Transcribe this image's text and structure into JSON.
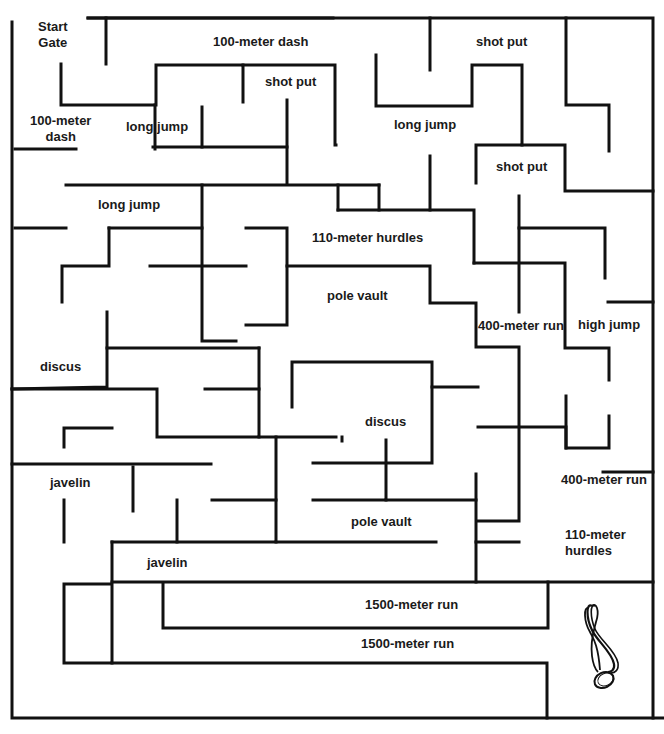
{
  "colors": {
    "wall": "#111111",
    "background": "#ffffff",
    "text": "#1a1a1a"
  },
  "labels": [
    {
      "id": "start-gate",
      "text": "Start\nGate",
      "x": 38,
      "y": 19,
      "center": true
    },
    {
      "id": "100m-dash-top",
      "text": "100-meter dash",
      "x": 213,
      "y": 34
    },
    {
      "id": "shot-put-top",
      "text": "shot put",
      "x": 476,
      "y": 34
    },
    {
      "id": "shot-put-mid",
      "text": "shot put",
      "x": 265,
      "y": 74
    },
    {
      "id": "100m-dash-left",
      "text": "100-meter\ndash",
      "x": 30,
      "y": 113,
      "center": true
    },
    {
      "id": "long-jump-1",
      "text": "long jump",
      "x": 126,
      "y": 119
    },
    {
      "id": "long-jump-2",
      "text": "long jump",
      "x": 394,
      "y": 117
    },
    {
      "id": "shot-put-right",
      "text": "shot put",
      "x": 496,
      "y": 159
    },
    {
      "id": "long-jump-3",
      "text": "long jump",
      "x": 98,
      "y": 197
    },
    {
      "id": "110m-hurdles-top",
      "text": "110-meter hurdles",
      "x": 312,
      "y": 230
    },
    {
      "id": "pole-vault-top",
      "text": "pole vault",
      "x": 327,
      "y": 288
    },
    {
      "id": "400m-run-mid",
      "text": "400-meter run",
      "x": 478,
      "y": 318
    },
    {
      "id": "high-jump",
      "text": "high jump",
      "x": 578,
      "y": 317
    },
    {
      "id": "discus-left",
      "text": "discus",
      "x": 40,
      "y": 359
    },
    {
      "id": "discus-mid",
      "text": "discus",
      "x": 365,
      "y": 414
    },
    {
      "id": "javelin-1",
      "text": "javelin",
      "x": 50,
      "y": 475
    },
    {
      "id": "400m-run-right",
      "text": "400-meter run",
      "x": 561,
      "y": 472
    },
    {
      "id": "pole-vault-bottom",
      "text": "pole vault",
      "x": 351,
      "y": 514
    },
    {
      "id": "110m-hurdles-bottom",
      "text": "110-meter\nhurdles",
      "x": 565,
      "y": 527
    },
    {
      "id": "javelin-2",
      "text": "javelin",
      "x": 147,
      "y": 555
    },
    {
      "id": "1500m-run-1",
      "text": "1500-meter run",
      "x": 365,
      "y": 597
    },
    {
      "id": "1500m-run-2",
      "text": "1500-meter run",
      "x": 361,
      "y": 636
    }
  ],
  "walls": [
    [
      [
        12,
        22
      ],
      [
        12,
        718
      ],
      [
        664,
        718
      ]
    ],
    [
      [
        88,
        18
      ],
      [
        333,
        18
      ],
      [
        333,
        18
      ]
    ],
    [
      [
        88,
        18
      ],
      [
        653,
        18
      ],
      [
        653,
        718
      ]
    ],
    [
      [
        106,
        18
      ],
      [
        106,
        64
      ]
    ],
    [
      [
        61,
        64
      ],
      [
        61,
        105
      ],
      [
        156,
        105
      ],
      [
        156,
        65
      ],
      [
        243,
        65
      ],
      [
        243,
        102
      ]
    ],
    [
      [
        243,
        65
      ],
      [
        335,
        65
      ],
      [
        335,
        145
      ],
      [
        336,
        145
      ]
    ],
    [
      [
        155,
        105
      ],
      [
        155,
        149
      ]
    ],
    [
      [
        15,
        149
      ],
      [
        76,
        149
      ]
    ],
    [
      [
        153,
        147
      ],
      [
        287,
        147
      ]
    ],
    [
      [
        202,
        107
      ],
      [
        202,
        147
      ]
    ],
    [
      [
        287,
        100
      ],
      [
        287,
        183
      ]
    ],
    [
      [
        66,
        185
      ],
      [
        379,
        185
      ]
    ],
    [
      [
        379,
        185
      ],
      [
        379,
        210
      ]
    ],
    [
      [
        430,
        18
      ],
      [
        430,
        70
      ]
    ],
    [
      [
        376,
        55
      ],
      [
        376,
        106
      ],
      [
        472,
        106
      ],
      [
        472,
        65
      ],
      [
        522,
        65
      ],
      [
        522,
        145
      ],
      [
        476,
        145
      ],
      [
        476,
        183
      ]
    ],
    [
      [
        566,
        18
      ],
      [
        566,
        105
      ],
      [
        609,
        105
      ],
      [
        609,
        151
      ]
    ],
    [
      [
        522,
        145
      ],
      [
        565,
        145
      ],
      [
        565,
        191
      ],
      [
        653,
        191
      ]
    ],
    [
      [
        430,
        156
      ],
      [
        430,
        210
      ]
    ],
    [
      [
        338,
        210
      ],
      [
        474,
        210
      ],
      [
        474,
        263
      ]
    ],
    [
      [
        338,
        185
      ],
      [
        338,
        210
      ]
    ],
    [
      [
        15,
        228
      ],
      [
        66,
        228
      ]
    ],
    [
      [
        202,
        185
      ],
      [
        202,
        341
      ],
      [
        236,
        341
      ]
    ],
    [
      [
        109,
        228
      ],
      [
        202,
        228
      ]
    ],
    [
      [
        109,
        228
      ],
      [
        109,
        266
      ],
      [
        62,
        266
      ],
      [
        62,
        302
      ]
    ],
    [
      [
        150,
        266
      ],
      [
        246,
        266
      ]
    ],
    [
      [
        246,
        228
      ],
      [
        287,
        228
      ],
      [
        287,
        325
      ],
      [
        246,
        325
      ]
    ],
    [
      [
        287,
        266
      ],
      [
        430,
        266
      ],
      [
        430,
        303
      ],
      [
        476,
        303
      ],
      [
        476,
        347
      ],
      [
        519,
        347
      ],
      [
        519,
        521
      ],
      [
        478,
        521
      ]
    ],
    [
      [
        474,
        263
      ],
      [
        565,
        263
      ],
      [
        565,
        348
      ],
      [
        609,
        348
      ],
      [
        609,
        380
      ]
    ],
    [
      [
        519,
        196
      ],
      [
        519,
        312
      ]
    ],
    [
      [
        519,
        228
      ],
      [
        605,
        228
      ],
      [
        605,
        278
      ]
    ],
    [
      [
        608,
        302
      ],
      [
        653,
        302
      ]
    ],
    [
      [
        107,
        312
      ],
      [
        107,
        387
      ],
      [
        12,
        389
      ]
    ],
    [
      [
        107,
        348
      ],
      [
        259,
        348
      ]
    ],
    [
      [
        259,
        348
      ],
      [
        259,
        437
      ],
      [
        157,
        437
      ],
      [
        157,
        389
      ],
      [
        12,
        389
      ]
    ],
    [
      [
        205,
        389
      ],
      [
        259,
        389
      ]
    ],
    [
      [
        259,
        437
      ],
      [
        336,
        437
      ]
    ],
    [
      [
        292,
        407
      ],
      [
        292,
        362
      ],
      [
        432,
        362
      ],
      [
        432,
        463
      ],
      [
        313,
        463
      ]
    ],
    [
      [
        432,
        387
      ],
      [
        478,
        387
      ]
    ],
    [
      [
        342,
        441
      ],
      [
        342,
        437
      ]
    ],
    [
      [
        478,
        427
      ],
      [
        566,
        427
      ],
      [
        566,
        448
      ],
      [
        609,
        448
      ],
      [
        609,
        416
      ]
    ],
    [
      [
        566,
        396
      ],
      [
        566,
        448
      ]
    ],
    [
      [
        386,
        440
      ],
      [
        386,
        500
      ],
      [
        313,
        500
      ]
    ],
    [
      [
        386,
        500
      ],
      [
        476,
        500
      ]
    ],
    [
      [
        476,
        474
      ],
      [
        476,
        582
      ]
    ],
    [
      [
        476,
        542
      ],
      [
        519,
        542
      ]
    ],
    [
      [
        64,
        447
      ],
      [
        64,
        428
      ],
      [
        112,
        428
      ]
    ],
    [
      [
        12,
        464
      ],
      [
        211,
        464
      ]
    ],
    [
      [
        276,
        437
      ],
      [
        276,
        542
      ],
      [
        112,
        542
      ]
    ],
    [
      [
        133,
        467
      ],
      [
        133,
        511
      ]
    ],
    [
      [
        177,
        500
      ],
      [
        177,
        542
      ]
    ],
    [
      [
        212,
        500
      ],
      [
        276,
        500
      ]
    ],
    [
      [
        64,
        500
      ],
      [
        64,
        542
      ]
    ],
    [
      [
        276,
        542
      ],
      [
        436,
        542
      ]
    ],
    [
      [
        603,
        472
      ],
      [
        653,
        472
      ]
    ],
    [
      [
        112,
        542
      ],
      [
        112,
        663
      ],
      [
        64,
        663
      ],
      [
        64,
        584
      ],
      [
        110,
        584
      ]
    ],
    [
      [
        112,
        582
      ],
      [
        653,
        582
      ]
    ],
    [
      [
        163,
        584
      ],
      [
        163,
        628
      ],
      [
        548,
        628
      ],
      [
        548,
        582
      ]
    ],
    [
      [
        112,
        663
      ],
      [
        547,
        663
      ],
      [
        547,
        718
      ]
    ]
  ],
  "trophy": {
    "icon": "medal-icon",
    "x": 578,
    "y": 600
  }
}
